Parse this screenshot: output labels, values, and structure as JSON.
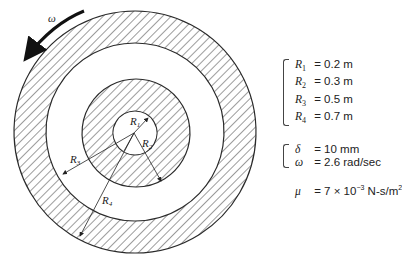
{
  "diagram": {
    "rotation_label": "ω",
    "radius_labels": [
      {
        "name": "R",
        "sub": "1"
      },
      {
        "name": "R",
        "sub": "2"
      },
      {
        "name": "R",
        "sub": "3"
      },
      {
        "name": "R",
        "sub": "4"
      }
    ],
    "colors": {
      "line": "#2a2a2a",
      "hatch": "#3a3a3a",
      "background": "#ffffff"
    }
  },
  "parameters": {
    "radii": [
      {
        "symbol": "R",
        "sub": "1",
        "eq": " = ",
        "value": "0.2 m"
      },
      {
        "symbol": "R",
        "sub": "2",
        "eq": " = ",
        "value": "0.3 m"
      },
      {
        "symbol": "R",
        "sub": "3",
        "eq": " = ",
        "value": "0.5 m"
      },
      {
        "symbol": "R",
        "sub": "4",
        "eq": " = ",
        "value": "0.7 m"
      }
    ],
    "others": [
      {
        "symbol": "δ",
        "eq": " = ",
        "value": "10 mm"
      },
      {
        "symbol": "ω",
        "eq": " = ",
        "value": "2.6 rad/sec"
      }
    ],
    "viscosity": {
      "symbol": "μ",
      "eq": " = ",
      "base": "7 × 10",
      "exp": "−3",
      "unit": " N-s/m",
      "unit_exp": "2"
    }
  }
}
